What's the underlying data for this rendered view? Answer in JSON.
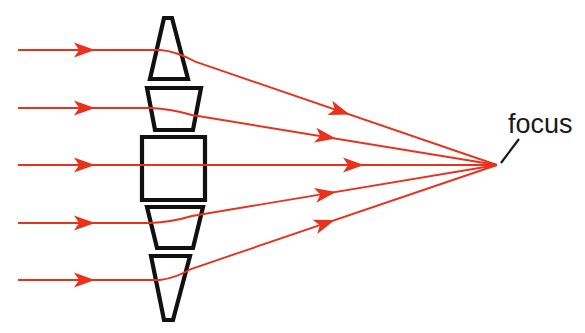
{
  "diagram": {
    "type": "optics-ray-diagram",
    "canvas": {
      "width": 585,
      "height": 333,
      "background": "#ffffff"
    },
    "colors": {
      "ray": "#e8321c",
      "ray_arrowhead": "#e8321c",
      "lens_outline": "#111111",
      "lens_fill": "#ffffff",
      "label_text": "#1a1a1a",
      "leader_line": "#1a1a1a"
    },
    "stroke_widths": {
      "ray": 1.9,
      "lens_outline": 4.2,
      "leader_line": 2.2
    },
    "focus_point": {
      "x": 497,
      "y": 165
    },
    "labels": [
      {
        "id": "focus-label",
        "text": "focus",
        "x": 508,
        "y": 133,
        "font_size": 27,
        "color": "#1a1a1a",
        "leader": {
          "x1": 501,
          "y1": 163,
          "x2": 519,
          "y2": 139
        }
      }
    ],
    "lens_elements": [
      {
        "id": "prism-top",
        "name": "top-prism",
        "shape": "triangle-apex-up",
        "points": "164,18 172,18 188,79 150,79"
      },
      {
        "id": "prism-upper",
        "name": "upper-trapezoid",
        "shape": "trapezoid-wide-top",
        "points": "147,88 201,88 193,130 155,130"
      },
      {
        "id": "prism-center",
        "name": "center-rectangle",
        "shape": "rectangle",
        "points": "142,137 205,137 205,200 142,200"
      },
      {
        "id": "prism-lower",
        "name": "lower-trapezoid",
        "shape": "trapezoid-wide-top",
        "points": "147,207 203,207 193,248 157,248"
      },
      {
        "id": "prism-bottom",
        "name": "bottom-prism",
        "shape": "triangle-apex-down",
        "points": "151,256 190,256 173,320 164,320"
      }
    ],
    "rays": [
      {
        "id": "ray-1",
        "name": "ray-top",
        "incoming_y": 50,
        "start_x": 18,
        "bend_x": 160,
        "exit_x": 196,
        "exit_y": 62,
        "incoming_arrow_x": 82,
        "outgoing_arrow_t": 0.47,
        "path": "M18,50 L160,50 Q176,51 196,62 L497,165"
      },
      {
        "id": "ray-2",
        "name": "ray-upper",
        "incoming_y": 108,
        "start_x": 18,
        "bend_x": 150,
        "exit_x": 192,
        "exit_y": 115,
        "incoming_arrow_x": 82,
        "outgoing_arrow_t": 0.43,
        "path": "M18,108 L150,108 Q172,109 192,115 L497,165"
      },
      {
        "id": "ray-3",
        "name": "ray-center",
        "incoming_y": 165,
        "start_x": 18,
        "bend_x": 205,
        "exit_x": 205,
        "exit_y": 165,
        "incoming_arrow_x": 82,
        "outgoing_arrow_t": 0.5,
        "path": "M18,165 L497,165"
      },
      {
        "id": "ray-4",
        "name": "ray-lower",
        "incoming_y": 223,
        "start_x": 18,
        "bend_x": 150,
        "exit_x": 192,
        "exit_y": 216,
        "incoming_arrow_x": 82,
        "outgoing_arrow_t": 0.43,
        "path": "M18,223 L150,223 Q172,222 192,216 L497,165"
      },
      {
        "id": "ray-5",
        "name": "ray-bottom",
        "incoming_y": 280,
        "start_x": 18,
        "bend_x": 160,
        "exit_x": 191,
        "exit_y": 269,
        "incoming_arrow_x": 82,
        "outgoing_arrow_t": 0.43,
        "path": "M18,280 L160,280 Q176,278 191,269 L497,165"
      }
    ]
  }
}
